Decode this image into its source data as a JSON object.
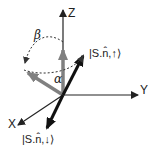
{
  "diagram": {
    "axes": {
      "z_label": "Z",
      "y_label": "Y",
      "x_label": "X"
    },
    "angles": {
      "alpha": "α",
      "beta": "β"
    },
    "states": {
      "up_ket": "|S.n̂,↑⟩",
      "down_ket": "|S.n̂,↓⟩"
    },
    "colors": {
      "axis": "#222222",
      "gray_vector": "#808080",
      "black_vector": "#111111",
      "dotted_arc": "#333333"
    }
  }
}
